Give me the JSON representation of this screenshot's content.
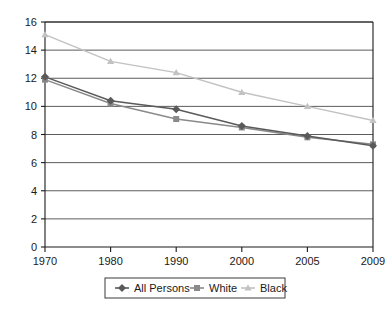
{
  "chart_data": {
    "type": "line",
    "title": "",
    "subtitle": "",
    "xlabel": "",
    "ylabel": "",
    "categories": [
      "1970",
      "1980",
      "1990",
      "2000",
      "2005",
      "2009"
    ],
    "ylim": [
      0,
      16
    ],
    "y_ticks": [
      0,
      2,
      4,
      6,
      8,
      10,
      12,
      14,
      16
    ],
    "y_tick_labels": [
      "0",
      "2",
      "4",
      "6",
      "8",
      "10",
      "12",
      "14",
      "16"
    ],
    "grid": true,
    "legend_position": "bottom",
    "series": [
      {
        "name": "All Persons",
        "marker": "diamond",
        "color": "#5a5a5a",
        "values": [
          12.1,
          10.4,
          9.8,
          8.6,
          7.9,
          7.2
        ]
      },
      {
        "name": "White",
        "marker": "square",
        "color": "#8a8a8a",
        "values": [
          11.9,
          10.2,
          9.1,
          8.5,
          7.8,
          7.3
        ]
      },
      {
        "name": "Black",
        "marker": "triangle",
        "color": "#c2c2c2",
        "values": [
          15.1,
          13.2,
          12.4,
          11.0,
          10.0,
          9.0
        ]
      }
    ]
  },
  "legend": {
    "items": [
      {
        "label": "All Persons"
      },
      {
        "label": "White"
      },
      {
        "label": "Black"
      }
    ]
  },
  "axes": {
    "x_tick_labels": [
      "1970",
      "1980",
      "1990",
      "2000",
      "2005",
      "2009"
    ],
    "y_tick_labels": [
      "16",
      "14",
      "12",
      "10",
      "8",
      "6",
      "4",
      "2",
      "0"
    ]
  },
  "colors": {
    "all_persons": "#5a5a5a",
    "white": "#8a8a8a",
    "black": "#c2c2c2",
    "axis": "#1a1a1a",
    "grid": "#4a4a4a",
    "background": "#ffffff"
  }
}
